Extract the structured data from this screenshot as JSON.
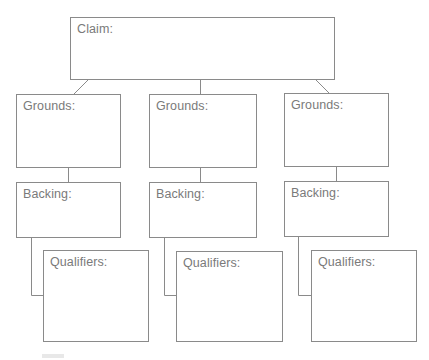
{
  "diagram": {
    "type": "toulmin-argument-organizer",
    "line_color": "#8a8a8a",
    "text_color": "#7a7a7a",
    "claim": {
      "label": "Claim:"
    },
    "columns": [
      {
        "grounds": {
          "label": "Grounds:"
        },
        "backing": {
          "label": "Backing:"
        },
        "qualifiers": {
          "label": "Qualifiers:"
        }
      },
      {
        "grounds": {
          "label": "Grounds:"
        },
        "backing": {
          "label": "Backing:"
        },
        "qualifiers": {
          "label": "Qualifiers:"
        }
      },
      {
        "grounds": {
          "label": "Grounds:"
        },
        "backing": {
          "label": "Backing:"
        },
        "qualifiers": {
          "label": "Qualifiers:"
        }
      }
    ]
  }
}
